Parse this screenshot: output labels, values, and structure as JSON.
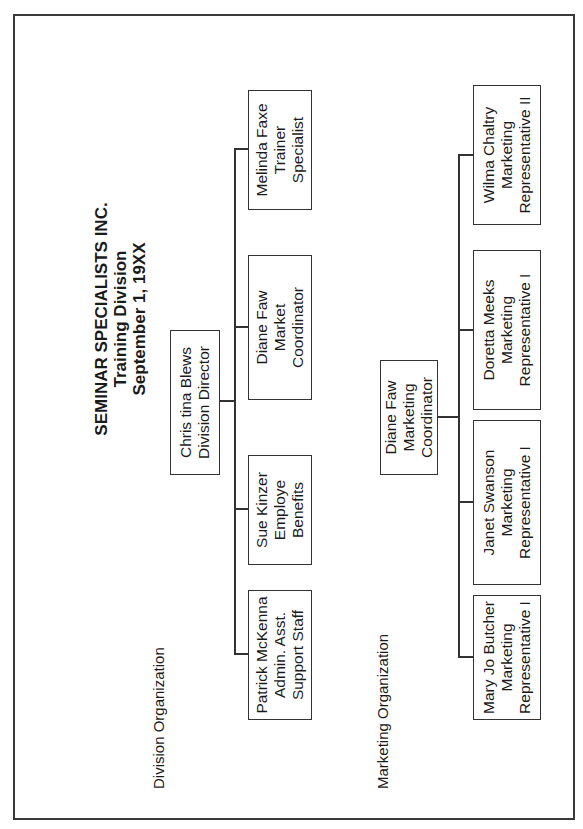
{
  "document": {
    "title_lines": [
      "SEMINAR SPECIALISTS INC.",
      "Training Division",
      "September 1, 19XX"
    ],
    "orientation": "rotated 90 degrees counter-clockwise (landscape page)"
  },
  "division_organization": {
    "label": "Division Organization",
    "head": {
      "name": "Chris tina Blews",
      "title": "Division Director"
    },
    "reports": [
      {
        "name": "Patrick McKenna",
        "title": "Admin. Asst.",
        "subtitle": "Support Staff"
      },
      {
        "name": "Sue Kinzer",
        "title": "Employe",
        "subtitle": "Benefits"
      },
      {
        "name": "Diane Faw",
        "title": "Market",
        "subtitle": "Coordinator"
      },
      {
        "name": "Melinda Faxe",
        "title": "Trainer",
        "subtitle": "Specialist"
      }
    ]
  },
  "marketing_organization": {
    "label": "Marketing Organization",
    "head": {
      "name": "Diane Faw",
      "title": "Marketing",
      "subtitle": "Coordinator"
    },
    "reports": [
      {
        "name": "Mary Jo Butcher",
        "title": "Marketing",
        "subtitle": "Representative I"
      },
      {
        "name": "Janet Swanson",
        "title": "Marketing",
        "subtitle": "Representative I"
      },
      {
        "name": "Doretta Meeks",
        "title": "Marketing",
        "subtitle": "Representative I"
      },
      {
        "name": "Wilma Chaltry",
        "title": "Marketing",
        "subtitle": "Representative II"
      }
    ]
  },
  "colors": {
    "ink": "#1a1a1a",
    "line": "#333333",
    "paper": "#ffffff"
  }
}
